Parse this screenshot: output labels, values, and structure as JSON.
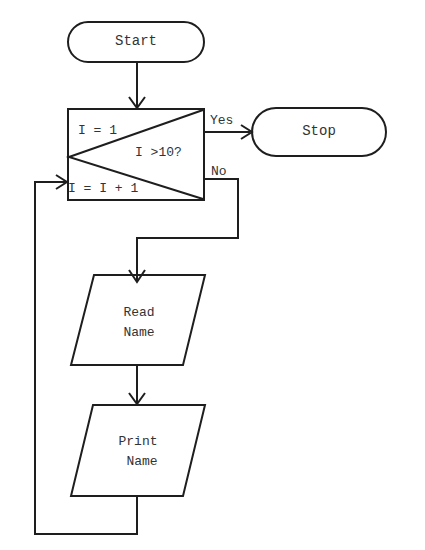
{
  "flowchart": {
    "start": {
      "label": "Start"
    },
    "stop": {
      "label": "Stop"
    },
    "loop_box": {
      "init": "I = 1",
      "condition": "I >10?",
      "increment": "I = I + 1"
    },
    "branches": {
      "yes": "Yes",
      "no": "No"
    },
    "read": {
      "line1": "Read",
      "line2": "Name"
    },
    "print": {
      "line1": "Print",
      "line2": "Name"
    }
  }
}
